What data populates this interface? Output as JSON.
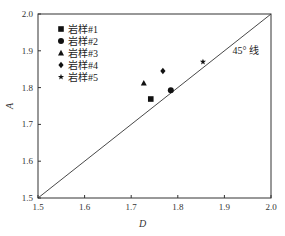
{
  "chart_data": {
    "type": "scatter",
    "title": "",
    "xlabel": "D",
    "ylabel": "A",
    "xlim": [
      1.5,
      2.0
    ],
    "ylim": [
      1.5,
      2.0
    ],
    "xticks": [
      "1.5",
      "1.6",
      "1.7",
      "1.8",
      "1.9",
      "2.0"
    ],
    "yticks": [
      "1.5",
      "1.6",
      "1.7",
      "1.8",
      "1.9",
      "2.0"
    ],
    "grid": false,
    "legend_position": "upper left",
    "series": [
      {
        "name": "岩样#1",
        "marker": "square",
        "x": 1.742,
        "y": 1.769
      },
      {
        "name": "岩样#2",
        "marker": "circle",
        "x": 1.785,
        "y": 1.793
      },
      {
        "name": "岩样#3",
        "marker": "triangle",
        "x": 1.727,
        "y": 1.812
      },
      {
        "name": "岩样#4",
        "marker": "diamond",
        "x": 1.768,
        "y": 1.845
      },
      {
        "name": "岩样#5",
        "marker": "star",
        "x": 1.854,
        "y": 1.87
      }
    ],
    "annotations": [
      {
        "text": "45° 线",
        "x": 1.93,
        "y": 1.87
      }
    ],
    "reference_line": {
      "label": "45° 线",
      "from": [
        1.5,
        1.5
      ],
      "to": [
        2.0,
        2.0
      ]
    }
  }
}
